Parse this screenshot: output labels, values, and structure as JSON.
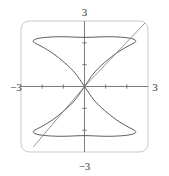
{
  "figure": {
    "title": "",
    "background_color": "#ffffff",
    "frame": {
      "color": "#c9c9c9",
      "corner_radius": 8,
      "x_px": 21,
      "y_px": 21,
      "w_px": 127,
      "h_px": 131
    }
  },
  "labels": {
    "x_min": "−3",
    "x_max": "3",
    "y_min": "−3",
    "y_max": "3"
  },
  "chart_data": {
    "type": "line",
    "title": "",
    "xlabel": "",
    "ylabel": "",
    "xlim": [
      -3,
      3
    ],
    "ylim": [
      -3,
      3
    ],
    "grid": false,
    "legend": "none",
    "axes": {
      "x_axis_color": "#6e6e6e",
      "y_axis_color": "#6e6e6e",
      "x_ticks": [
        -2,
        -1,
        1,
        2
      ],
      "y_ticks": [
        -2,
        -1,
        1,
        2
      ],
      "tick_labels_shown": [
        "-3",
        "3",
        "-3",
        "3"
      ],
      "axis_origin": [
        0,
        0
      ]
    },
    "series": [
      {
        "name": "figure-eight-curve",
        "type": "closed-parametric",
        "color": "#4a4a4a",
        "description": "vertical figure-eight / bowtie crossing itself at the origin, upper lobe peaks near y=2.1 and lower lobe dips near y=-2.1, lobes widen to about x=±2.4",
        "points": [
          [
            0.0,
            0.0
          ],
          [
            0.45,
            0.62
          ],
          [
            0.95,
            1.1
          ],
          [
            1.5,
            1.52
          ],
          [
            2.0,
            1.82
          ],
          [
            2.35,
            2.0
          ],
          [
            2.42,
            2.1
          ],
          [
            2.2,
            2.2
          ],
          [
            1.7,
            2.26
          ],
          [
            1.0,
            2.28
          ],
          [
            0.0,
            2.25
          ],
          [
            -1.0,
            2.28
          ],
          [
            -1.7,
            2.26
          ],
          [
            -2.2,
            2.2
          ],
          [
            -2.42,
            2.1
          ],
          [
            -2.35,
            2.0
          ],
          [
            -2.0,
            1.82
          ],
          [
            -1.5,
            1.52
          ],
          [
            -0.95,
            1.1
          ],
          [
            -0.45,
            0.62
          ],
          [
            0.0,
            0.0
          ],
          [
            0.45,
            -0.62
          ],
          [
            0.95,
            -1.1
          ],
          [
            1.5,
            -1.52
          ],
          [
            2.0,
            -1.82
          ],
          [
            2.35,
            -2.0
          ],
          [
            2.42,
            -2.1
          ],
          [
            2.2,
            -2.2
          ],
          [
            1.7,
            -2.26
          ],
          [
            1.0,
            -2.28
          ],
          [
            0.0,
            -2.25
          ],
          [
            -1.0,
            -2.28
          ],
          [
            -1.7,
            -2.26
          ],
          [
            -2.2,
            -2.2
          ],
          [
            -2.42,
            -2.1
          ],
          [
            -2.35,
            -2.0
          ],
          [
            -2.0,
            -1.82
          ],
          [
            -1.5,
            -1.52
          ],
          [
            -0.95,
            -1.1
          ],
          [
            -0.45,
            -0.62
          ],
          [
            0.0,
            0.0
          ]
        ]
      },
      {
        "name": "diagonal-line",
        "type": "line",
        "color": "#8a8a8a",
        "description": "straight line through the origin with slope about 1.15, drawn from lower-left to upper-right across the frame",
        "points": [
          [
            -2.4,
            -2.75
          ],
          [
            0.0,
            0.0
          ],
          [
            2.95,
            3.0
          ]
        ]
      }
    ]
  }
}
